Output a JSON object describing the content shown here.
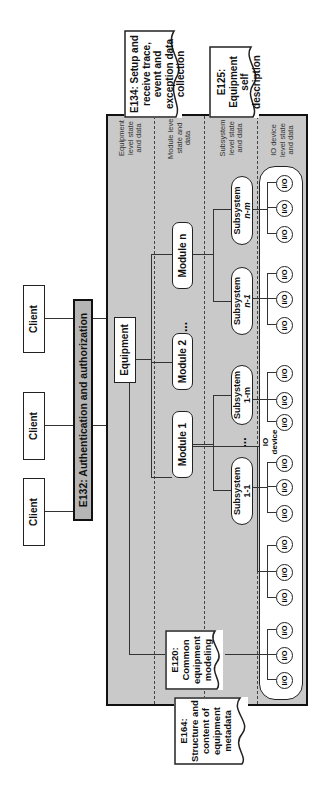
{
  "clients": [
    "Client",
    "Client",
    "Client"
  ],
  "client_ellipsis": "...",
  "auth_bar": "E132: Authentication and authorization",
  "equipment": "Equipment",
  "modules": [
    "Module 1",
    "Module 2",
    "Module n"
  ],
  "module_ellipsis": "...",
  "subsystems": [
    {
      "line1": "Subsystem",
      "line2": "1-1"
    },
    {
      "line1": "Subsystem",
      "line2": "1-m"
    },
    {
      "line1": "Subsystem",
      "line2": "n-1"
    },
    {
      "line1": "Subsystem",
      "line2": "n-m"
    }
  ],
  "subsystem_ellipsis": [
    "...",
    "..."
  ],
  "io_label": "I/O",
  "io_device_label": "IO device",
  "levels": [
    "Equipment level state and data",
    "Module level state and data",
    "Subsystem level state and data",
    "IO device level state and data"
  ],
  "docs": {
    "e134": "E134: Setup and receive trace, event and exception data collection",
    "e125": "E125: Equipment self description",
    "e120": "E120: Common equipment modeling",
    "e164": "E164: Structure and content of equipment metadata"
  }
}
